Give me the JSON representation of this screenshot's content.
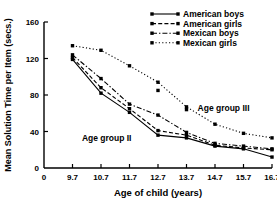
{
  "chart_data": {
    "type": "line",
    "title": "",
    "xlabel": "Age of child (years)",
    "ylabel": "Mean Solution Time per Item (secs.)",
    "x": [
      9.7,
      10.7,
      11.7,
      12.7,
      13.7,
      14.7,
      15.7,
      16.7
    ],
    "xtick_labels": [
      "0",
      "9.7",
      "10.7",
      "11.7",
      "12.7",
      "13.7",
      "14.7",
      "15.7",
      "16.7"
    ],
    "ytick_labels": [
      "0",
      "40",
      "80",
      "120",
      "160"
    ],
    "yticks": [
      0,
      40,
      80,
      120,
      160
    ],
    "xlim": [
      8.7,
      16.7
    ],
    "ylim": [
      0,
      160
    ],
    "grid": false,
    "legend_position": "top-right",
    "series": [
      {
        "name": "American boys",
        "style": "solid",
        "marker": "square",
        "values": [
          119,
          82,
          61,
          36,
          33,
          24,
          21,
          12
        ]
      },
      {
        "name": "American girls",
        "style": "dashed",
        "marker": "square",
        "values": [
          121,
          88,
          65,
          41,
          36,
          25,
          22,
          20
        ]
      },
      {
        "name": "Mexican boys",
        "style": "dashdot",
        "marker": "square",
        "values": [
          124,
          98,
          70,
          58,
          39,
          27,
          24,
          21
        ]
      },
      {
        "name": "Mexican girls",
        "style": "dotted",
        "marker": "square",
        "values": [
          134,
          129,
          112,
          94,
          67,
          48,
          38,
          33
        ]
      }
    ],
    "extra_points": [
      {
        "series": "Mexican girls",
        "x": 12.7,
        "y": 85
      },
      {
        "series": "Mexican girls",
        "x": 13.7,
        "y": 64
      }
    ],
    "annotations": [
      {
        "text": "Age group II",
        "x": 10.9,
        "y": 30
      },
      {
        "text": "Age group III",
        "x": 15.0,
        "y": 62
      }
    ]
  }
}
